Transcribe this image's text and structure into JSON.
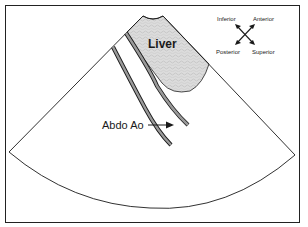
{
  "diagram": {
    "type": "ultrasound-schematic",
    "labels": {
      "liver": "Liver",
      "aorta": "Abdo Ao"
    },
    "orientation": {
      "top_left": "Inferior",
      "top_right": "Anterior",
      "bottom_left": "Posterior",
      "bottom_right": "Superior"
    },
    "colors": {
      "outline": "#1a1a1a",
      "liver_fill": "#d9d9d9",
      "vessel_wall": "#8c8c8c",
      "background": "#ffffff"
    }
  }
}
